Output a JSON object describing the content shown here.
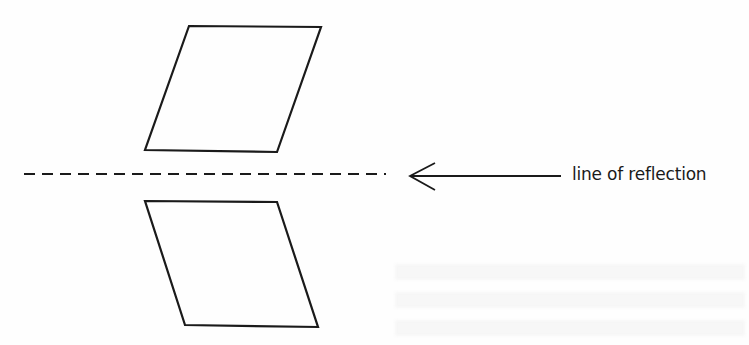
{
  "diagram": {
    "label": "line of reflection",
    "colors": {
      "stroke": "#1a1a1a",
      "background": "#ffffff"
    },
    "original_shape": {
      "type": "parallelogram",
      "points": "189,26 321,27 277,152 145,150"
    },
    "reflected_shape": {
      "type": "parallelogram",
      "points": "145,201 277,202 318,327 185,325"
    },
    "reflection_line": {
      "style": "dashed",
      "x1": 24,
      "y1": 174,
      "x2": 386,
      "y2": 174
    },
    "arrow": {
      "x1": 561,
      "y1": 176,
      "x2": 410,
      "y2": 176,
      "head": "435,163 410,176 435,190"
    }
  }
}
